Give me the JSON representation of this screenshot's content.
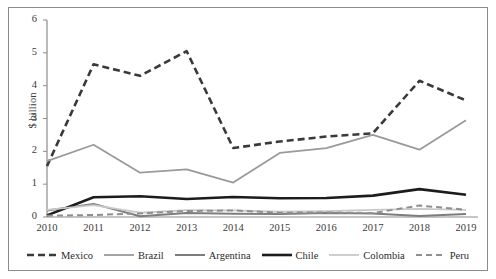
{
  "figure": {
    "border_color": "#8c8c8c",
    "background": "#ffffff"
  },
  "axes": {
    "ylabel": "$ billion",
    "yticks": [
      "0",
      "1",
      "2",
      "3",
      "4",
      "5",
      "6"
    ],
    "xticks": [
      "2010",
      "2011",
      "2012",
      "2013",
      "2014",
      "2015",
      "2016",
      "2017",
      "2018",
      "2019"
    ]
  },
  "legend": {
    "items": [
      {
        "label": "Mexico",
        "color": "#3a3a3a",
        "width": 2.6,
        "dash": "7,4"
      },
      {
        "label": "Brazil",
        "color": "#9a9a9a",
        "width": 1.8,
        "dash": "none"
      },
      {
        "label": "Argentina",
        "color": "#7d7d7d",
        "width": 2.0,
        "dash": "none"
      },
      {
        "label": "Chile",
        "color": "#1c1c1c",
        "width": 2.6,
        "dash": "none"
      },
      {
        "label": "Colombia",
        "color": "#c9c9c9",
        "width": 1.8,
        "dash": "none"
      },
      {
        "label": "Peru",
        "color": "#8f8f8f",
        "width": 2.0,
        "dash": "6,4"
      }
    ]
  },
  "chart_data": {
    "type": "line",
    "title": "",
    "xlabel": "",
    "ylabel": "$ billion",
    "ylim": [
      0,
      6
    ],
    "grid": false,
    "legend_position": "bottom",
    "categories": [
      "2010",
      "2011",
      "2012",
      "2013",
      "2014",
      "2015",
      "2016",
      "2017",
      "2018",
      "2019"
    ],
    "series": [
      {
        "name": "Mexico",
        "color": "#3a3a3a",
        "linestyle": "dashed",
        "values": [
          1.55,
          4.65,
          4.3,
          5.05,
          2.1,
          2.3,
          2.45,
          2.55,
          4.15,
          3.55
        ]
      },
      {
        "name": "Brazil",
        "color": "#9a9a9a",
        "linestyle": "solid",
        "values": [
          1.7,
          2.2,
          1.35,
          1.45,
          1.05,
          1.95,
          2.1,
          2.5,
          2.05,
          2.95
        ]
      },
      {
        "name": "Argentina",
        "color": "#7d7d7d",
        "linestyle": "solid",
        "values": [
          0.2,
          0.4,
          0.02,
          0.12,
          0.1,
          0.09,
          0.12,
          0.11,
          0.03,
          0.09
        ]
      },
      {
        "name": "Chile",
        "color": "#1c1c1c",
        "linestyle": "solid",
        "values": [
          0.05,
          0.6,
          0.63,
          0.55,
          0.61,
          0.57,
          0.58,
          0.65,
          0.85,
          0.68
        ]
      },
      {
        "name": "Colombia",
        "color": "#c9c9c9",
        "linestyle": "solid",
        "values": [
          0.22,
          0.36,
          0.13,
          0.21,
          0.2,
          0.16,
          0.18,
          0.22,
          0.25,
          0.22
        ]
      },
      {
        "name": "Peru",
        "color": "#8f8f8f",
        "linestyle": "dashed",
        "values": [
          0.04,
          0.06,
          0.11,
          0.18,
          0.2,
          0.13,
          0.14,
          0.12,
          0.35,
          0.22
        ]
      }
    ]
  }
}
